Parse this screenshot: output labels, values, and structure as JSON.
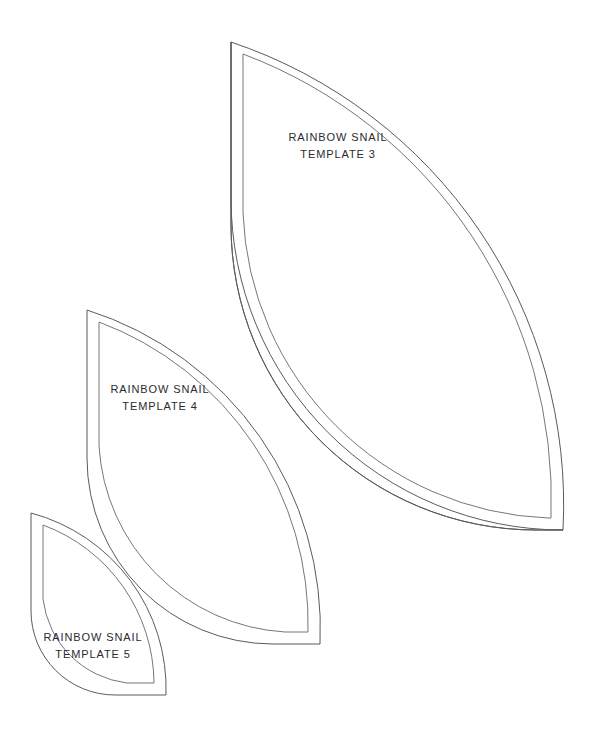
{
  "page": {
    "background_color": "#ffffff",
    "width": 601,
    "height": 729
  },
  "style": {
    "outline_color": "#5b5b5f",
    "inline_color": "#77777b",
    "label_color": "#2b2b2d"
  },
  "templates": [
    {
      "id": "template-3",
      "name": "RAINBOW SNAIL",
      "number": "3",
      "label_line1": "RAINBOW SNAIL",
      "label_line2": "TEMPLATE 3",
      "size": "large",
      "geometry": {
        "center_x": 231,
        "center_y": 530,
        "outer_radius": 488,
        "inner_radius": 305,
        "seam_offset": 12
      }
    },
    {
      "id": "template-4",
      "name": "RAINBOW SNAIL",
      "number": "4",
      "label_line1": "RAINBOW SNAIL",
      "label_line2": "TEMPLATE 4",
      "size": "medium",
      "geometry": {
        "center_x": 87,
        "center_y": 644,
        "outer_radius": 334,
        "inner_radius": 186,
        "seam_offset": 12
      }
    },
    {
      "id": "template-5",
      "name": "RAINBOW SNAIL",
      "number": "5",
      "label_line1": "RAINBOW SNAIL",
      "label_line2": "TEMPLATE 5",
      "size": "small",
      "geometry": {
        "center_x": 31,
        "center_y": 695,
        "outer_radius": 182,
        "inner_radius": 84,
        "seam_offset": 12
      }
    }
  ]
}
